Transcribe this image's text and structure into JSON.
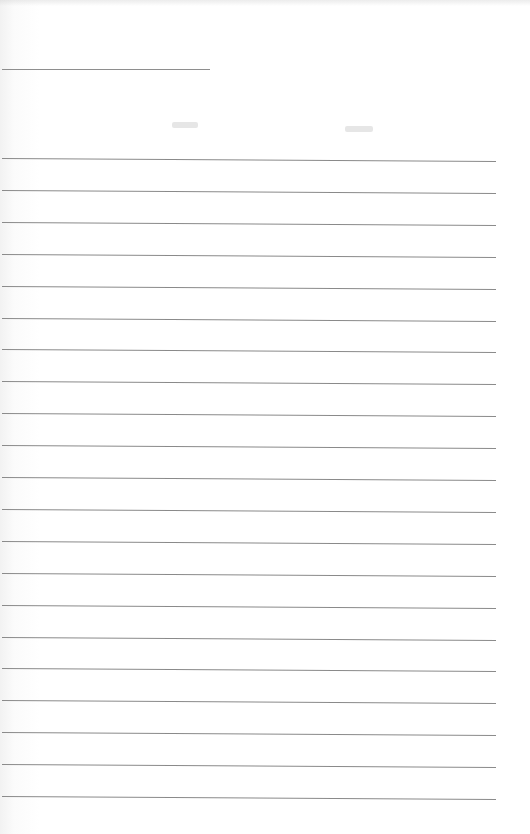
{
  "page": {
    "type": "blank lined sheet",
    "header_rule": {
      "top": 69,
      "left": 2,
      "width": 208
    },
    "faint_marks": [
      {
        "left": 172,
        "top": 122,
        "width": 26
      },
      {
        "left": 345,
        "top": 126,
        "width": 28
      }
    ],
    "ruled_lines": {
      "count": 21,
      "first_top": 158,
      "spacing": 31.9,
      "left": 2,
      "width": 494
    },
    "colors": {
      "paper": "#ffffff",
      "rule": "#8a8a8a"
    }
  }
}
